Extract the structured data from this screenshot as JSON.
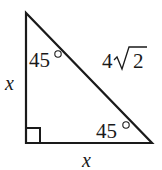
{
  "diagram": {
    "type": "right-triangle",
    "stroke_color": "#1a1a1a",
    "vertices": {
      "top": [
        26,
        13
      ],
      "bottom_left_right_angle": [
        26,
        143
      ],
      "bottom_right": [
        152,
        143
      ]
    },
    "labels": {
      "left_leg": "x",
      "bottom_leg": "x",
      "hypotenuse_coefficient": "4",
      "hypotenuse_radicand": "2",
      "top_angle_value": "45",
      "top_angle_degree": "°",
      "bottom_right_angle_value": "45",
      "bottom_right_angle_degree": "°"
    },
    "right_angle_marker": true
  }
}
